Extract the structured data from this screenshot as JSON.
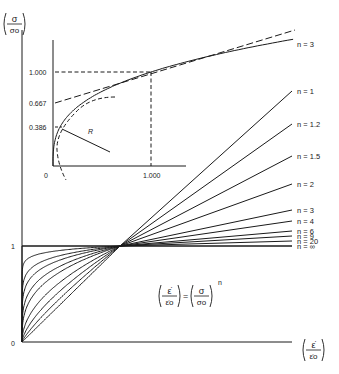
{
  "diagram": {
    "main_axes": {
      "y_axis_label": {
        "num": "σ",
        "den": "σo"
      },
      "x_axis_label": {
        "num": "ε̇",
        "den": "ε̇o"
      },
      "origin_label": "0",
      "unit_label": "1"
    },
    "equation": {
      "lhs_num": "ε̇",
      "lhs_den": "ε̇o",
      "equals": "=",
      "rhs_num": "σ",
      "rhs_den": "σo",
      "exponent": "n"
    },
    "family_curves": [
      {
        "n": 1,
        "label": "n = 1",
        "end_y": 91
      },
      {
        "n": 1.2,
        "label": "n = 1.2",
        "end_y": 124
      },
      {
        "n": 1.5,
        "label": "n = 1.5",
        "end_y": 156
      },
      {
        "n": 2,
        "label": "n = 2",
        "end_y": 184
      },
      {
        "n": 3,
        "label": "n = 3",
        "end_y": 210
      },
      {
        "n": 4,
        "label": "n = 4",
        "end_y": 221
      },
      {
        "n": 6,
        "label": "n = 6",
        "end_y": 231
      },
      {
        "n": 9,
        "label": "n = 9",
        "end_y": 236
      },
      {
        "n": 20,
        "label": "n = 20",
        "end_y": 241
      },
      {
        "n": "∞",
        "label": "n = ∞",
        "end_y": 246
      }
    ],
    "inset": {
      "curve_label": "n = 3",
      "y_ticks": [
        "1.000",
        "0.667",
        "0.386"
      ],
      "x_ticks": [
        "1.000"
      ],
      "origin_label": "0",
      "radius_label": "R"
    }
  }
}
